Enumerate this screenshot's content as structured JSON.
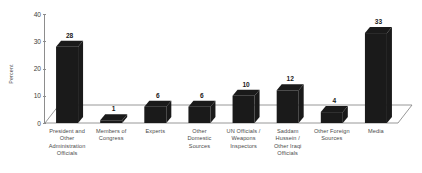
{
  "chart_data": {
    "type": "bar",
    "title": "",
    "xlabel": "",
    "ylabel": "Percent",
    "ylim": [
      0,
      40
    ],
    "yticks": [
      0,
      10,
      20,
      30,
      40
    ],
    "grid": false,
    "legend": "none",
    "style": "3d-column",
    "bar_color": "#1a1a1a",
    "categories": [
      "President and Other Administration Officials",
      "Members of Congress",
      "Experts",
      "Other Domestic Sources",
      "UN Officials / Weapons Inspectors",
      "Saddam Hussein / Other Iraqi Officials",
      "Other Foreign Sources",
      "Media"
    ],
    "category_lines": [
      [
        "President and",
        "Other",
        "Administration",
        "Officials"
      ],
      [
        "Members of",
        "Congress"
      ],
      [
        "Experts"
      ],
      [
        "Other",
        "Domestic",
        "Sources"
      ],
      [
        "UN Officials /",
        "Weapons",
        "Inspectors"
      ],
      [
        "Saddam",
        "Hussein /",
        "Other Iraqi",
        "Officials"
      ],
      [
        "Other Foreign",
        "Sources"
      ],
      [
        "Media"
      ]
    ],
    "values": [
      28,
      1,
      6,
      6,
      10,
      12,
      4,
      33
    ],
    "value_labels": [
      "28",
      "1",
      "6",
      "6",
      "10",
      "12",
      "4",
      "33"
    ]
  },
  "axis": {
    "y_tick_labels": [
      "40",
      "30",
      "20",
      "10",
      "0"
    ],
    "y_title": "Percent"
  }
}
